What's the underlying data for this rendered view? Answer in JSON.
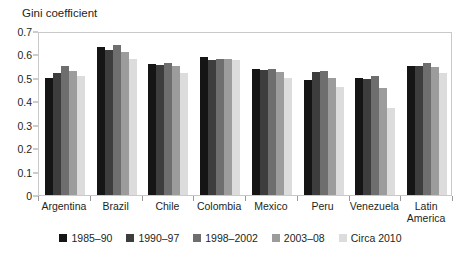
{
  "chart_data": {
    "type": "bar",
    "title": "Gini coefficient",
    "xlabel": "",
    "ylabel": "",
    "ylim": [
      0,
      0.7
    ],
    "ytick_labels": [
      "0.7",
      "0.6",
      "0.5",
      "0.4",
      "0.3",
      "0.2",
      "0.1",
      "0"
    ],
    "ytick_values": [
      0.7,
      0.6,
      0.5,
      0.4,
      0.3,
      0.2,
      0.1,
      0
    ],
    "grid": false,
    "legend_position": "bottom",
    "categories": [
      "Argentina",
      "Brazil",
      "Chile",
      "Colombia",
      "Mexico",
      "Peru",
      "Venezuela",
      "Latin America"
    ],
    "series": [
      {
        "name": "1985–90",
        "color": "#151515",
        "values": [
          0.5,
          0.63,
          0.56,
          0.59,
          0.54,
          0.49,
          0.5,
          0.55
        ]
      },
      {
        "name": "1990–97",
        "color": "#3d3d3d",
        "values": [
          0.52,
          0.62,
          0.555,
          0.575,
          0.535,
          0.525,
          0.495,
          0.55
        ]
      },
      {
        "name": "1998–2002",
        "color": "#6e6e6e",
        "values": [
          0.55,
          0.64,
          0.565,
          0.58,
          0.54,
          0.53,
          0.51,
          0.565
        ]
      },
      {
        "name": "2003–08",
        "color": "#9c9c9c",
        "values": [
          0.53,
          0.61,
          0.55,
          0.58,
          0.525,
          0.5,
          0.455,
          0.545
        ]
      },
      {
        "name": "Circa 2010",
        "color": "#dcdcdc",
        "values": [
          0.51,
          0.58,
          0.52,
          0.575,
          0.5,
          0.46,
          0.37,
          0.52
        ]
      }
    ]
  },
  "legend": {
    "items": [
      {
        "label": "1985–90",
        "color": "#151515"
      },
      {
        "label": "1990–97",
        "color": "#3d3d3d"
      },
      {
        "label": "1998–2002",
        "color": "#6e6e6e"
      },
      {
        "label": "2003–08",
        "color": "#9c9c9c"
      },
      {
        "label": "Circa 2010",
        "color": "#dcdcdc"
      }
    ]
  },
  "axis": {
    "tick_color": "#9a9a9a",
    "frame_color": "#c9c9c9"
  }
}
